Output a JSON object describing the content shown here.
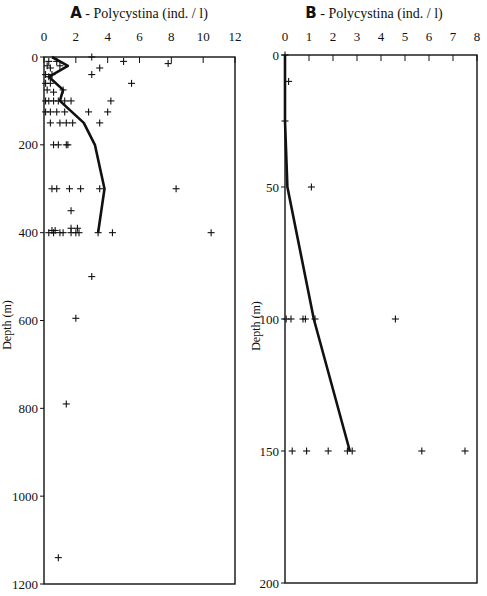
{
  "chart_data": [
    {
      "type": "scatter",
      "panel": "A",
      "title_letter": "A",
      "title": "Polycystina  (ind. / l)",
      "xlabel": "Polycystina (ind. / l)",
      "ylabel": "Depth (m)",
      "xlim": [
        0,
        12
      ],
      "ylim": [
        0,
        1200
      ],
      "y_inverted": true,
      "x_axis_position": "top",
      "xticks": [
        0,
        2,
        4,
        6,
        8,
        10,
        12
      ],
      "yticks": [
        0,
        200,
        400,
        600,
        800,
        1000,
        1200
      ],
      "show_ylabel": true,
      "grid": false,
      "series": [
        {
          "name": "samples",
          "kind": "scatter",
          "points": [
            {
              "x": 3.0,
              "y": 0
            },
            {
              "x": 0.3,
              "y": 10
            },
            {
              "x": 0.8,
              "y": 10
            },
            {
              "x": 5.0,
              "y": 10
            },
            {
              "x": 7.8,
              "y": 15
            },
            {
              "x": 3.5,
              "y": 25
            },
            {
              "x": 0.2,
              "y": 20
            },
            {
              "x": 0.4,
              "y": 25
            },
            {
              "x": 1.0,
              "y": 20
            },
            {
              "x": 0.1,
              "y": 40
            },
            {
              "x": 0.3,
              "y": 45
            },
            {
              "x": 0.5,
              "y": 40
            },
            {
              "x": 3.0,
              "y": 40
            },
            {
              "x": 0.1,
              "y": 60
            },
            {
              "x": 0.4,
              "y": 60
            },
            {
              "x": 5.5,
              "y": 60
            },
            {
              "x": 0.2,
              "y": 75
            },
            {
              "x": 0.6,
              "y": 80
            },
            {
              "x": 1.2,
              "y": 75
            },
            {
              "x": 0.1,
              "y": 100
            },
            {
              "x": 0.3,
              "y": 100
            },
            {
              "x": 0.6,
              "y": 100
            },
            {
              "x": 0.9,
              "y": 100
            },
            {
              "x": 1.3,
              "y": 100
            },
            {
              "x": 1.7,
              "y": 100
            },
            {
              "x": 4.2,
              "y": 100
            },
            {
              "x": 0.1,
              "y": 125
            },
            {
              "x": 0.4,
              "y": 125
            },
            {
              "x": 0.8,
              "y": 125
            },
            {
              "x": 1.3,
              "y": 125
            },
            {
              "x": 2.8,
              "y": 125
            },
            {
              "x": 4.0,
              "y": 125
            },
            {
              "x": 0.4,
              "y": 150
            },
            {
              "x": 1.0,
              "y": 150
            },
            {
              "x": 1.4,
              "y": 150
            },
            {
              "x": 1.8,
              "y": 150
            },
            {
              "x": 3.5,
              "y": 150
            },
            {
              "x": 0.6,
              "y": 200
            },
            {
              "x": 0.9,
              "y": 200
            },
            {
              "x": 1.4,
              "y": 200
            },
            {
              "x": 1.5,
              "y": 200
            },
            {
              "x": 0.5,
              "y": 300
            },
            {
              "x": 0.8,
              "y": 300
            },
            {
              "x": 1.6,
              "y": 300
            },
            {
              "x": 2.3,
              "y": 300
            },
            {
              "x": 3.5,
              "y": 300
            },
            {
              "x": 8.3,
              "y": 300
            },
            {
              "x": 0.3,
              "y": 400
            },
            {
              "x": 0.6,
              "y": 400
            },
            {
              "x": 1.0,
              "y": 400
            },
            {
              "x": 1.2,
              "y": 400
            },
            {
              "x": 1.7,
              "y": 400
            },
            {
              "x": 2.0,
              "y": 400
            },
            {
              "x": 3.4,
              "y": 400
            },
            {
              "x": 4.3,
              "y": 400
            },
            {
              "x": 10.5,
              "y": 400
            },
            {
              "x": 1.7,
              "y": 350
            },
            {
              "x": 0.5,
              "y": 395
            },
            {
              "x": 0.7,
              "y": 395
            },
            {
              "x": 1.7,
              "y": 390
            },
            {
              "x": 2.1,
              "y": 390
            },
            {
              "x": 2.2,
              "y": 400
            },
            {
              "x": 3.0,
              "y": 500
            },
            {
              "x": 2.0,
              "y": 595
            },
            {
              "x": 1.4,
              "y": 790
            },
            {
              "x": 0.9,
              "y": 1140
            }
          ]
        },
        {
          "name": "mean profile",
          "kind": "line",
          "points": [
            {
              "x": 0.5,
              "y": 0
            },
            {
              "x": 1.5,
              "y": 20
            },
            {
              "x": 0.3,
              "y": 45
            },
            {
              "x": 1.2,
              "y": 75
            },
            {
              "x": 1.0,
              "y": 100
            },
            {
              "x": 2.5,
              "y": 150
            },
            {
              "x": 3.2,
              "y": 200
            },
            {
              "x": 3.8,
              "y": 300
            },
            {
              "x": 3.4,
              "y": 400
            }
          ]
        }
      ]
    },
    {
      "type": "scatter",
      "panel": "B",
      "title_letter": "B",
      "title": "Polycystina  (ind. / l)",
      "xlabel": "Polycystina (ind. / l)",
      "ylabel": "Depth (m)",
      "xlim": [
        0,
        8
      ],
      "ylim": [
        0,
        200
      ],
      "y_inverted": true,
      "x_axis_position": "top",
      "xticks": [
        0,
        1,
        2,
        3,
        4,
        5,
        6,
        7,
        8
      ],
      "yticks": [
        0,
        50,
        100,
        150,
        200
      ],
      "show_ylabel": true,
      "grid": false,
      "series": [
        {
          "name": "samples",
          "kind": "scatter",
          "points": [
            {
              "x": 0.0,
              "y": 0
            },
            {
              "x": 0.15,
              "y": 10
            },
            {
              "x": 0.0,
              "y": 25
            },
            {
              "x": 1.1,
              "y": 50
            },
            {
              "x": 0.05,
              "y": 100
            },
            {
              "x": 0.25,
              "y": 100
            },
            {
              "x": 0.75,
              "y": 100
            },
            {
              "x": 0.85,
              "y": 100
            },
            {
              "x": 1.25,
              "y": 100
            },
            {
              "x": 4.6,
              "y": 100
            },
            {
              "x": 0.3,
              "y": 150
            },
            {
              "x": 0.9,
              "y": 150
            },
            {
              "x": 1.8,
              "y": 150
            },
            {
              "x": 2.6,
              "y": 150
            },
            {
              "x": 2.8,
              "y": 150
            },
            {
              "x": 5.7,
              "y": 150
            },
            {
              "x": 7.5,
              "y": 150
            }
          ]
        },
        {
          "name": "mean profile",
          "kind": "line",
          "points": [
            {
              "x": 0.0,
              "y": 0
            },
            {
              "x": 0.0,
              "y": 25
            },
            {
              "x": 0.1,
              "y": 50
            },
            {
              "x": 1.2,
              "y": 100
            },
            {
              "x": 2.7,
              "y": 150
            }
          ]
        }
      ]
    }
  ]
}
